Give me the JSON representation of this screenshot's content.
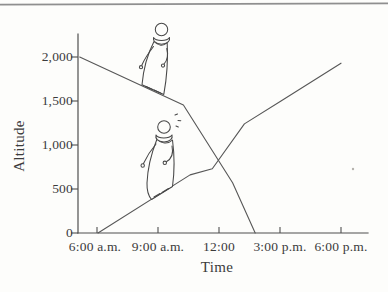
{
  "figure": {
    "background_color": "#fdfdfb",
    "line_color": "#575757",
    "text_color": "#3b3b3b",
    "top_rule_color": "#8f8f8f"
  },
  "chart_data": {
    "type": "line",
    "title": "",
    "xlabel": "Time",
    "ylabel": "Altitude",
    "x_tick_labels": [
      "6:00 a.m.",
      "9:00 a.m.",
      "12:00",
      "3:00 p.m.",
      "6:00 p.m."
    ],
    "y_tick_labels": [
      "0",
      "500",
      "1,000",
      "1,500",
      "2,000"
    ],
    "y_tick_values": [
      0,
      500,
      1000,
      1500,
      2000
    ],
    "ylim": [
      0,
      2250
    ],
    "grid": false,
    "legend": "none",
    "series": [
      {
        "name": "ascending-path",
        "points": [
          {
            "time": "6:00 a.m.",
            "t": 6.05,
            "altitude": 0
          },
          {
            "time": "10:35 a.m.",
            "t": 10.58,
            "altitude": 660
          },
          {
            "time": "11:40 a.m.",
            "t": 11.67,
            "altitude": 730
          },
          {
            "time": "1:15 p.m.",
            "t": 13.25,
            "altitude": 1240
          },
          {
            "time": "3:00 p.m.",
            "t": 15.05,
            "altitude": 1500
          },
          {
            "time": "6:00 p.m.",
            "t": 18.0,
            "altitude": 1930
          }
        ]
      },
      {
        "name": "descending-path",
        "points": [
          {
            "time": "6:00 a.m.",
            "t": 5.15,
            "altitude": 2000
          },
          {
            "time": "10:15 a.m.",
            "t": 10.25,
            "altitude": 1455
          },
          {
            "time": "12:40 p.m.",
            "t": 12.67,
            "altitude": 570
          },
          {
            "time": "1:45 p.m.",
            "t": 13.78,
            "altitude": 0
          }
        ]
      }
    ],
    "crossing_point": {
      "time": "12:00",
      "altitude": 825
    },
    "annotations": [
      "hand-drawn monk figure walking down the descending line",
      "hand-drawn monk figure with sweat marks walking up the ascending line"
    ]
  }
}
